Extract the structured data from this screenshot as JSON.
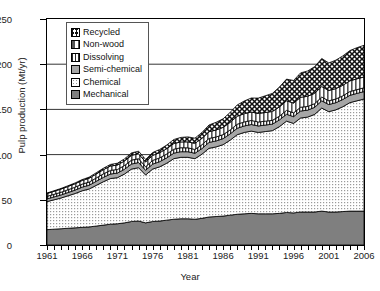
{
  "chart_data": {
    "type": "area",
    "title": "",
    "xlabel": "Year",
    "ylabel": "Pulp production (Mt/yr)",
    "stacked": true,
    "grid": true,
    "legend_position": "top-left",
    "xlim": [
      1961,
      2006
    ],
    "ylim": [
      0,
      250
    ],
    "yticks": [
      0,
      50,
      100,
      150,
      200,
      250
    ],
    "gridlines": [
      100,
      150,
      200
    ],
    "xticks": [
      1961,
      1966,
      1971,
      1976,
      1981,
      1986,
      1991,
      1996,
      2001,
      2006
    ],
    "x": [
      1961,
      1962,
      1963,
      1964,
      1965,
      1966,
      1967,
      1968,
      1969,
      1970,
      1971,
      1972,
      1973,
      1974,
      1975,
      1976,
      1977,
      1978,
      1979,
      1980,
      1981,
      1982,
      1983,
      1984,
      1985,
      1986,
      1987,
      1988,
      1989,
      1990,
      1991,
      1992,
      1993,
      1994,
      1995,
      1996,
      1997,
      1998,
      1999,
      2000,
      2001,
      2002,
      2003,
      2004,
      2005,
      2006
    ],
    "series": [
      {
        "name": "Mechanical",
        "pattern": "solid-dark-gray",
        "color": "#7f7f7f",
        "values": [
          17,
          17.5,
          18,
          18.5,
          19,
          19.5,
          20,
          21,
          22,
          23,
          23.5,
          24.5,
          26,
          26.5,
          24.5,
          26,
          26.5,
          27.5,
          28.5,
          29,
          29,
          28.5,
          29.5,
          31,
          31.5,
          32,
          33,
          34,
          34.5,
          35,
          34.5,
          34.5,
          34.5,
          35,
          36,
          35.5,
          36.5,
          36.5,
          36.5,
          37.5,
          36.5,
          36.5,
          37,
          37.5,
          37.5,
          37.5
        ]
      },
      {
        "name": "Chemical",
        "pattern": "fine-dots",
        "color": "#f2f2f2",
        "values": [
          31,
          32.5,
          34,
          36,
          38,
          40.5,
          42,
          45,
          48,
          50.5,
          51,
          54,
          58,
          59,
          53,
          58,
          60,
          63,
          67,
          68,
          68,
          67,
          71,
          76,
          77,
          79,
          83,
          88,
          90,
          91,
          90,
          91,
          92,
          96,
          101,
          99,
          104,
          105,
          108,
          114,
          111,
          113,
          116,
          120,
          122,
          124
        ]
      },
      {
        "name": "Semi-chemical",
        "pattern": "solid-mid-gray",
        "color": "#a6a6a6",
        "values": [
          3,
          3.2,
          3.4,
          3.6,
          3.8,
          4,
          4.2,
          4.5,
          4.8,
          5,
          5.1,
          5.3,
          5.6,
          5.7,
          5.2,
          5.5,
          5.7,
          5.9,
          6.1,
          6.2,
          6.2,
          6,
          6.2,
          6.5,
          6.6,
          6.7,
          6.9,
          7.1,
          7.2,
          7.3,
          7.2,
          7.2,
          7.2,
          7.4,
          7.6,
          7.5,
          7.7,
          7.7,
          7.8,
          8,
          7.9,
          7.9,
          8,
          8.1,
          8.2,
          8.2
        ]
      },
      {
        "name": "Dissolving",
        "pattern": "vertical-bars",
        "color": "#ffffff",
        "values": [
          2.8,
          2.9,
          3,
          3.1,
          3.2,
          3.4,
          3.5,
          3.7,
          3.9,
          4,
          4,
          4.1,
          4.3,
          4.3,
          3.9,
          4.1,
          4.2,
          4.3,
          4.4,
          4.4,
          4.3,
          4.2,
          4.3,
          4.4,
          4.4,
          4.4,
          4.4,
          4.5,
          4.5,
          4.5,
          4.4,
          4.3,
          4.2,
          4.2,
          4.3,
          4.2,
          4.2,
          4.1,
          4.1,
          4.2,
          4.1,
          4.1,
          4.1,
          4.2,
          4.2,
          4.2
        ]
      },
      {
        "name": "Non-wood",
        "pattern": "split-vertical",
        "color": "#ffffff",
        "values": [
          3.2,
          3.3,
          3.5,
          3.6,
          3.8,
          4,
          4.2,
          4.4,
          4.6,
          4.8,
          4.9,
          5.1,
          5.3,
          5.4,
          5.2,
          5.5,
          5.7,
          5.9,
          6.2,
          6.4,
          6.6,
          6.7,
          7,
          7.4,
          7.7,
          8,
          8.4,
          8.8,
          9.1,
          9.3,
          9.4,
          9.6,
          9.8,
          10.2,
          10.6,
          10.8,
          11,
          11.2,
          11.4,
          11.6,
          11.4,
          11.5,
          11.6,
          11.8,
          11.9,
          12
        ]
      },
      {
        "name": "Recycled",
        "pattern": "cross-hatch",
        "color": "#ffffff",
        "values": [
          0.5,
          0.6,
          0.7,
          0.8,
          0.9,
          1,
          1.2,
          1.4,
          1.6,
          1.8,
          2,
          2.3,
          2.7,
          2.9,
          2.8,
          3.2,
          3.6,
          4,
          4.5,
          5,
          5.5,
          5.8,
          6.5,
          7.5,
          8.5,
          9.5,
          11,
          12.5,
          14,
          15.5,
          17,
          18.5,
          20,
          22,
          24,
          25,
          27,
          28,
          29.5,
          31,
          30.5,
          31.5,
          32.5,
          33.5,
          34.5,
          35
        ]
      }
    ]
  },
  "legend": {
    "items": [
      {
        "label": "Recycled"
      },
      {
        "label": "Non-wood"
      },
      {
        "label": "Dissolving"
      },
      {
        "label": "Semi-chemical"
      },
      {
        "label": "Chemical"
      },
      {
        "label": "Mechanical"
      }
    ]
  }
}
